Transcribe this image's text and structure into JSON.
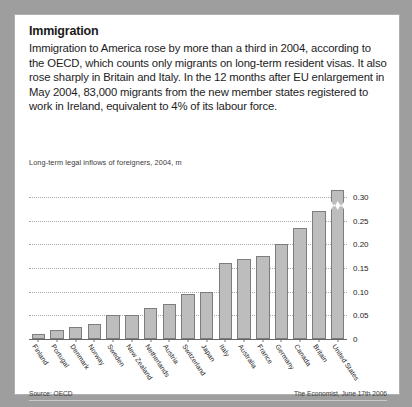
{
  "article": {
    "headline": "Immigration",
    "body": "Immigration to America rose by more than a third in 2004, according to the OECD, which counts only migrants on long-term resident visas. It also rose sharply in Britain and Italy. In the 12 months after EU enlargement in May 2004, 83,000 migrants from the new member states registered to work in Ireland, equivalent to 4% of its labour force."
  },
  "footer": {
    "source": "Source: OECD",
    "credit": "The Economist, June 17th 2006"
  },
  "chart_data": {
    "type": "bar",
    "title": "Long-term legal inflows of foreigners, 2004, m",
    "xlabel": "",
    "ylabel": "",
    "ylim": [
      0,
      0.3
    ],
    "grid": true,
    "legend": null,
    "tick_labels": [
      "0",
      "0.05",
      "0.10",
      "0.15",
      "0.20",
      "0.25",
      "0.30"
    ],
    "tick_values": [
      0,
      0.05,
      0.1,
      0.15,
      0.2,
      0.25,
      0.3
    ],
    "axis_break": {
      "category": "United States",
      "note": "bar truncated with zigzag break above 0.30"
    },
    "categories": [
      "Finland",
      "Portugal",
      "Denmark",
      "Norway",
      "Sweden",
      "New Zealand",
      "Netherlands",
      "Austria",
      "Switzerland",
      "Japan",
      "Italy",
      "Australia",
      "France",
      "Germany",
      "Canada",
      "Britain",
      "United States"
    ],
    "values": [
      0.01,
      0.02,
      0.025,
      0.032,
      0.05,
      0.05,
      0.065,
      0.075,
      0.095,
      0.1,
      0.16,
      0.17,
      0.175,
      0.2,
      0.235,
      0.27,
      0.33
    ]
  }
}
